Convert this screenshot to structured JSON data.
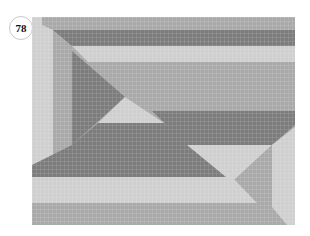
{
  "badge": {
    "number": "78"
  },
  "pattern": {
    "colors": {
      "light": "#cfcfcf",
      "mid": "#a9a9a9",
      "dark": "#7c7c7c",
      "grid": "#ffffff"
    },
    "grid_cell_px": 4
  }
}
